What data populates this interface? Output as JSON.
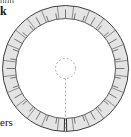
{
  "figure": {
    "name": "annular-ring-cross-section",
    "width": 131,
    "height": 137,
    "background_color": "#ffffff"
  },
  "surrounding_text": {
    "top_left_clipped": "nnn",
    "top_left_letter": "k",
    "bottom_left_clipped": "ers"
  },
  "drawing": {
    "center_x": 65.5,
    "center_y": 68.5,
    "outer_radius": 63,
    "ring_inner_radius": 50,
    "band_thickness": 13,
    "stroke_color": "#4a4a4a",
    "stroke_width": 0.9,
    "ring_fill_color": "#dcdcdc",
    "ring_fill_opacity": 0.75,
    "inner_fill_color": "#ffffff",
    "tick_color": "#6b6b6b",
    "tick_width": 0.8,
    "segment_count": 24,
    "tick_count": 36,
    "split_angle_deg": 90,
    "split_gap_deg": 2.2,
    "hub_circle": {
      "radius": 10,
      "dash": "2 2",
      "color": "#9a9a9a"
    },
    "centerline": {
      "from_y": 78,
      "to_y": 133,
      "dash": "2 2",
      "color": "#9a9a9a"
    }
  },
  "chart_data": {
    "type": "scatter",
    "xlabel": "",
    "ylabel": "",
    "categories": [],
    "values": []
  }
}
